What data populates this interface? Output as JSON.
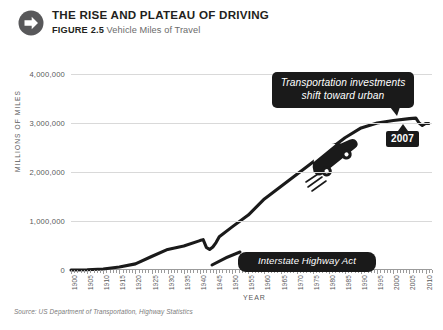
{
  "header": {
    "icon": "arrow-right-circle-icon",
    "title": "THE RISE AND PLATEAU OF DRIVING",
    "figure_label": "FIGURE 2.5",
    "figure_text": "Vehicle Miles of Travel"
  },
  "source": "Source: US Department of Transportation, Highway Statistics",
  "colors": {
    "line": "#1a1a1a",
    "grid": "#d9d9d9",
    "axis": "#9b9b9b",
    "tick_text": "#58585a",
    "callout_bg": "#1a1a1a",
    "callout_text": "#ffffff",
    "title": "#231f20",
    "subtitle": "#6b6b6b"
  },
  "chart_data": {
    "type": "line",
    "title": "THE RISE AND PLATEAU OF DRIVING",
    "subtitle": "FIGURE 2.5 Vehicle Miles of Travel",
    "xlabel": "YEAR",
    "ylabel": "MILLIONS OF MILES",
    "xlim": [
      1900,
      2012
    ],
    "ylim": [
      0,
      4000000
    ],
    "grid": true,
    "legend": "none",
    "ytick_labels": [
      "0",
      "1,000,000",
      "2,000,000",
      "3,000,000",
      "4,000,000"
    ],
    "ytick_values": [
      0,
      1000000,
      2000000,
      3000000,
      4000000
    ],
    "xtick_labels": [
      "1900",
      "1905",
      "1910",
      "1915",
      "1920",
      "1925",
      "1930",
      "1935",
      "1940",
      "1945",
      "1950",
      "1955",
      "1960",
      "1965",
      "1970",
      "1975",
      "1980",
      "1985",
      "1990",
      "1995",
      "2000",
      "2005",
      "2010"
    ],
    "xtick_values": [
      1900,
      1905,
      1910,
      1915,
      1920,
      1925,
      1930,
      1935,
      1940,
      1945,
      1950,
      1955,
      1960,
      1965,
      1970,
      1975,
      1980,
      1985,
      1990,
      1995,
      2000,
      2005,
      2010
    ],
    "series": [
      {
        "name": "Vehicle Miles of Travel",
        "x": [
          1900,
          1905,
          1910,
          1915,
          1920,
          1925,
          1930,
          1935,
          1940,
          1941,
          1942,
          1943,
          1944,
          1945,
          1946,
          1950,
          1955,
          1960,
          1965,
          1970,
          1975,
          1980,
          1985,
          1990,
          1995,
          2000,
          2005,
          2007,
          2008,
          2009,
          2010,
          2011
        ],
        "values": [
          0,
          5000,
          20000,
          60000,
          125000,
          275000,
          420000,
          490000,
          600000,
          620000,
          460000,
          420000,
          470000,
          560000,
          680000,
          880000,
          1120000,
          1450000,
          1700000,
          1950000,
          2200000,
          2600000,
          2800000,
          3100000,
          3250000,
          3500000,
          3800000,
          3900000,
          3800000,
          3750000,
          3800000,
          3800000
        ],
        "y_plotted": [
          0,
          5000,
          20000,
          60000,
          125000,
          275000,
          420000,
          490000,
          600000,
          620000,
          460000,
          420000,
          470000,
          560000,
          680000,
          880000,
          1120000,
          1450000,
          1700000,
          1950000,
          2200000,
          2450000,
          2700000,
          2900000,
          3000000,
          3050000,
          3090000,
          3100000,
          3000000,
          2950000,
          2990000,
          2990000
        ]
      }
    ],
    "annotations": [
      {
        "id": "urban-investment-callout",
        "text_line1": "Transportation investments",
        "text_line2": "shift toward urban",
        "style": "black-rounded-callout"
      },
      {
        "id": "interstate-highway-callout",
        "text": "Interstate Highway Act",
        "style": "black-rounded-callout",
        "points_to_year": 1956
      },
      {
        "id": "peak-year-badge",
        "text": "2007",
        "style": "black-box-badge"
      }
    ],
    "decorations": [
      "car-illustration"
    ]
  }
}
